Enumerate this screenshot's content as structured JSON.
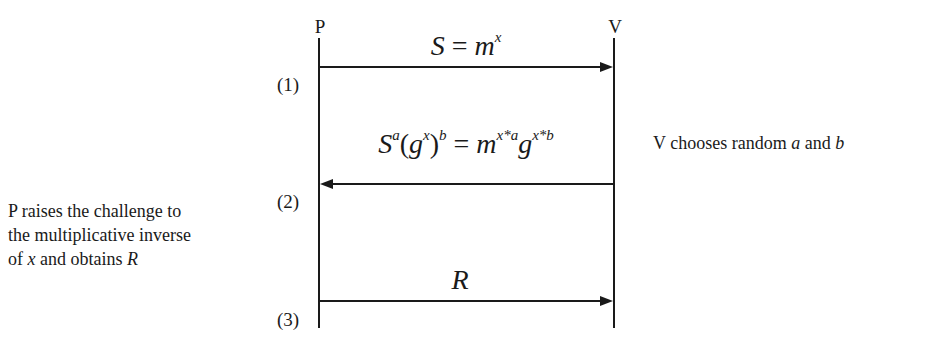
{
  "diagram": {
    "type": "sequence",
    "participants": [
      {
        "id": "P",
        "label": "P"
      },
      {
        "id": "V",
        "label": "V"
      }
    ],
    "steps": [
      {
        "number_label": "(1)",
        "from": "P",
        "to": "V",
        "message": {
          "base1": "S",
          "eq": "=",
          "base2": "m",
          "exp2": "x"
        }
      },
      {
        "number_label": "(2)",
        "from": "V",
        "to": "P",
        "message": {
          "t1": "S",
          "e1": "a",
          "t2": "(",
          "t3": "g",
          "e3": "x",
          "t4": ")",
          "e4": "b",
          "eq": "=",
          "t5": "m",
          "e5": "x*a",
          "t6": "g",
          "e6": "x*b"
        }
      },
      {
        "number_label": "(3)",
        "from": "P",
        "to": "V",
        "message": {
          "text": "R"
        }
      }
    ],
    "notes": {
      "verifier": {
        "prefix": "V chooses random",
        "var_a": "a",
        "and": "and",
        "var_b": "b"
      },
      "prover": {
        "line1": "P raises the challenge to",
        "line2": "the multiplicative inverse",
        "line3_prefix": "of",
        "line3_var": "x",
        "line3_mid": "and obtains",
        "line3_var2": "R"
      }
    },
    "colors": {
      "line": "#1a1a1a",
      "background": "#ffffff"
    }
  }
}
